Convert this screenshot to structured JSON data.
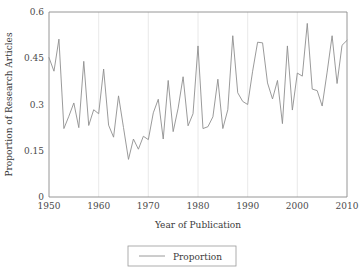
{
  "chart_data": {
    "type": "line",
    "title": "",
    "xlabel": "Year of Publication",
    "ylabel": "Proportion of Research Articles",
    "xlim": [
      1950,
      2010
    ],
    "ylim": [
      0,
      0.6
    ],
    "grid": "vertical-only",
    "legend_position": "bottom-center",
    "xticks": [
      1950,
      1960,
      1970,
      1980,
      1990,
      2000,
      2010
    ],
    "xtick_labels": [
      "1950",
      "1960",
      "1970",
      "1980",
      "1990",
      "2000",
      "2010"
    ],
    "yticks": [
      0,
      0.15,
      0.3,
      0.45,
      0.6
    ],
    "ytick_labels": [
      "0",
      "0.15",
      "0.3",
      "0.45",
      "0.6"
    ],
    "series": [
      {
        "name": "Proportion",
        "color": "#8f8f8f",
        "x": [
          1950,
          1951,
          1952,
          1953,
          1954,
          1955,
          1956,
          1957,
          1958,
          1959,
          1960,
          1961,
          1962,
          1963,
          1964,
          1965,
          1966,
          1967,
          1968,
          1969,
          1970,
          1971,
          1972,
          1973,
          1974,
          1975,
          1976,
          1977,
          1978,
          1979,
          1980,
          1981,
          1982,
          1983,
          1984,
          1985,
          1986,
          1987,
          1988,
          1989,
          1990,
          1991,
          1992,
          1993,
          1994,
          1995,
          1996,
          1997,
          1998,
          1999,
          2000,
          2001,
          2002,
          2003,
          2004,
          2005,
          2006,
          2007,
          2008,
          2009,
          2010
        ],
        "values": [
          0.452,
          0.408,
          0.512,
          0.222,
          0.262,
          0.305,
          0.225,
          0.44,
          0.232,
          0.283,
          0.27,
          0.415,
          0.233,
          0.194,
          0.328,
          0.225,
          0.122,
          0.188,
          0.155,
          0.197,
          0.186,
          0.273,
          0.317,
          0.188,
          0.378,
          0.212,
          0.288,
          0.39,
          0.231,
          0.27,
          0.49,
          0.222,
          0.228,
          0.26,
          0.382,
          0.222,
          0.283,
          0.523,
          0.338,
          0.31,
          0.3,
          0.408,
          0.502,
          0.5,
          0.37,
          0.318,
          0.378,
          0.238,
          0.49,
          0.282,
          0.402,
          0.392,
          0.563,
          0.35,
          0.345,
          0.295,
          0.405,
          0.523,
          0.368,
          0.492,
          0.508
        ]
      }
    ]
  },
  "legend": {
    "entries": [
      {
        "label": "Proportion"
      }
    ]
  }
}
